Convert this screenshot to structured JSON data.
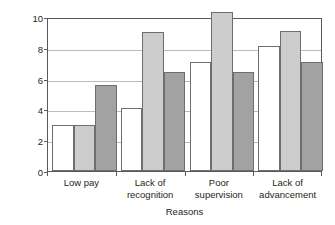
{
  "chart_data": {
    "type": "bar",
    "title": "",
    "xlabel": "Reasons",
    "ylabel": "Number of Occurrences",
    "categories": [
      "Low pay",
      "Lack of\nrecognition",
      "Poor\nsupervision",
      "Lack of\nadvancement"
    ],
    "series": [
      {
        "name": "series-a",
        "color": "#ffffff",
        "values": [
          3.0,
          4.1,
          7.05,
          8.15
        ]
      },
      {
        "name": "series-b",
        "color": "#cdcdcd",
        "values": [
          3.0,
          9.0,
          10.3,
          9.1
        ]
      },
      {
        "name": "series-c",
        "color": "#a2a2a2",
        "values": [
          5.6,
          6.4,
          6.45,
          7.1
        ]
      }
    ],
    "ylim": [
      0,
      10
    ],
    "yticks": [
      0,
      2,
      4,
      6,
      8,
      10
    ],
    "ytick_labels": [
      "0",
      "2",
      "4",
      "6",
      "8",
      "10"
    ],
    "grid": true,
    "legend": "none",
    "axis_color": "#58595b",
    "grid_color": "#b9bbbd",
    "bar_edge_color": "#6d6e71"
  }
}
